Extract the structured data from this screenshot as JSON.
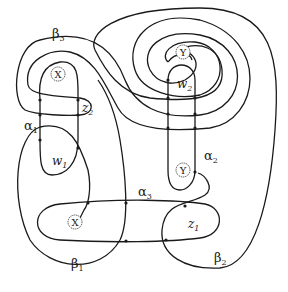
{
  "diagram": {
    "type": "heegaard-diagram",
    "curves": {
      "alpha": [
        {
          "name": "α",
          "sub": "1"
        },
        {
          "name": "α",
          "sub": "2"
        },
        {
          "name": "α",
          "sub": "3"
        }
      ],
      "beta": [
        {
          "name": "β",
          "sub": "1"
        },
        {
          "name": "β",
          "sub": "2"
        },
        {
          "name": "β",
          "sub": "3"
        }
      ]
    },
    "basepoints": [
      {
        "label": "X"
      },
      {
        "label": "X"
      },
      {
        "label": "Y"
      },
      {
        "label": "Y"
      }
    ],
    "regions": [
      {
        "name": "w",
        "sub": "1"
      },
      {
        "name": "w",
        "sub": "2"
      },
      {
        "name": "z",
        "sub": "1"
      },
      {
        "name": "z",
        "sub": "2"
      }
    ]
  }
}
